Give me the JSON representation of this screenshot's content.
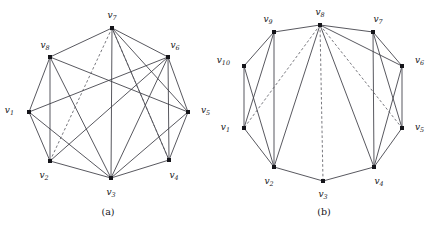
{
  "figure": {
    "background": "#ffffff",
    "edge_color": "#3a3a42",
    "dashed_edge_color": "#55555d",
    "vertex_color": "#15151a",
    "label_color": "#15151a"
  },
  "panels": [
    {
      "id": "a",
      "caption": "(a)",
      "graph": {
        "type": "graph-diagram",
        "vertex_count": 8,
        "vertices": [
          {
            "id": "v1",
            "label": "v",
            "sub": "1",
            "x": 29,
            "y": 112,
            "label_x": 14,
            "label_y": 113,
            "anchor": "end"
          },
          {
            "id": "v2",
            "label": "v",
            "sub": "2",
            "x": 50,
            "y": 161,
            "label_x": 44,
            "label_y": 178,
            "anchor": "middle"
          },
          {
            "id": "v3",
            "label": "v",
            "sub": "3",
            "x": 111,
            "y": 178,
            "label_x": 111,
            "label_y": 195,
            "anchor": "middle"
          },
          {
            "id": "v4",
            "label": "v",
            "sub": "4",
            "x": 169,
            "y": 160,
            "label_x": 174,
            "label_y": 178,
            "anchor": "middle"
          },
          {
            "id": "v5",
            "label": "v",
            "sub": "5",
            "x": 188,
            "y": 112,
            "label_x": 201,
            "label_y": 113,
            "anchor": "start"
          },
          {
            "id": "v6",
            "label": "v",
            "sub": "6",
            "x": 168,
            "y": 57,
            "label_x": 175,
            "label_y": 48,
            "anchor": "middle"
          },
          {
            "id": "v7",
            "label": "v",
            "sub": "7",
            "x": 112,
            "y": 28,
            "label_x": 112,
            "label_y": 18,
            "anchor": "middle"
          },
          {
            "id": "v8",
            "label": "v",
            "sub": "8",
            "x": 50,
            "y": 57,
            "label_x": 45,
            "label_y": 48,
            "anchor": "middle"
          }
        ],
        "edges_solid": [
          [
            "v1",
            "v8"
          ],
          [
            "v1",
            "v2"
          ],
          [
            "v1",
            "v3"
          ],
          [
            "v1",
            "v6"
          ],
          [
            "v2",
            "v8"
          ],
          [
            "v2",
            "v3"
          ],
          [
            "v2",
            "v6"
          ],
          [
            "v3",
            "v4"
          ],
          [
            "v3",
            "v5"
          ],
          [
            "v3",
            "v6"
          ],
          [
            "v3",
            "v7"
          ],
          [
            "v3",
            "v8"
          ],
          [
            "v4",
            "v5"
          ],
          [
            "v4",
            "v6"
          ],
          [
            "v4",
            "v7"
          ],
          [
            "v5",
            "v6"
          ],
          [
            "v5",
            "v7"
          ],
          [
            "v5",
            "v8"
          ],
          [
            "v6",
            "v7"
          ],
          [
            "v7",
            "v8"
          ]
        ],
        "edges_dashed": [
          [
            "v7",
            "v2"
          ],
          [
            "v7",
            "v4"
          ]
        ]
      }
    },
    {
      "id": "b",
      "caption": "(b)",
      "graph": {
        "type": "graph-diagram",
        "vertex_count": 10,
        "vertices": [
          {
            "id": "v1",
            "label": "v",
            "sub": "1",
            "x": 28,
            "y": 128,
            "label_x": 14,
            "label_y": 130,
            "anchor": "end"
          },
          {
            "id": "v2",
            "label": "v",
            "sub": "2",
            "x": 58,
            "y": 167,
            "label_x": 53,
            "label_y": 184,
            "anchor": "middle"
          },
          {
            "id": "v3",
            "label": "v",
            "sub": "3",
            "x": 107,
            "y": 181,
            "label_x": 107,
            "label_y": 197,
            "anchor": "middle"
          },
          {
            "id": "v4",
            "label": "v",
            "sub": "4",
            "x": 158,
            "y": 167,
            "label_x": 163,
            "label_y": 184,
            "anchor": "middle"
          },
          {
            "id": "v5",
            "label": "v",
            "sub": "5",
            "x": 186,
            "y": 128,
            "label_x": 199,
            "label_y": 130,
            "anchor": "start"
          },
          {
            "id": "v6",
            "label": "v",
            "sub": "6",
            "x": 186,
            "y": 66,
            "label_x": 199,
            "label_y": 63,
            "anchor": "start"
          },
          {
            "id": "v7",
            "label": "v",
            "sub": "7",
            "x": 157,
            "y": 32,
            "label_x": 162,
            "label_y": 22,
            "anchor": "middle"
          },
          {
            "id": "v8",
            "label": "v",
            "sub": "8",
            "x": 104,
            "y": 25,
            "label_x": 104,
            "label_y": 15,
            "anchor": "middle"
          },
          {
            "id": "v9",
            "label": "v",
            "sub": "9",
            "x": 58,
            "y": 32,
            "label_x": 52,
            "label_y": 22,
            "anchor": "middle"
          },
          {
            "id": "v10",
            "label": "v",
            "sub": "10",
            "x": 28,
            "y": 66,
            "label_x": 14,
            "label_y": 63,
            "anchor": "end"
          }
        ],
        "edges_solid": [
          [
            "v1",
            "v10"
          ],
          [
            "v1",
            "v2"
          ],
          [
            "v1",
            "v9"
          ],
          [
            "v2",
            "v3"
          ],
          [
            "v2",
            "v10"
          ],
          [
            "v2",
            "v9"
          ],
          [
            "v2",
            "v8"
          ],
          [
            "v3",
            "v4"
          ],
          [
            "v4",
            "v5"
          ],
          [
            "v4",
            "v6"
          ],
          [
            "v4",
            "v7"
          ],
          [
            "v4",
            "v8"
          ],
          [
            "v5",
            "v6"
          ],
          [
            "v5",
            "v7"
          ],
          [
            "v6",
            "v7"
          ],
          [
            "v6",
            "v8"
          ],
          [
            "v7",
            "v8"
          ],
          [
            "v8",
            "v9"
          ],
          [
            "v9",
            "v10"
          ]
        ],
        "edges_dashed": [
          [
            "v8",
            "v1"
          ],
          [
            "v8",
            "v3"
          ],
          [
            "v8",
            "v5"
          ]
        ]
      }
    }
  ]
}
